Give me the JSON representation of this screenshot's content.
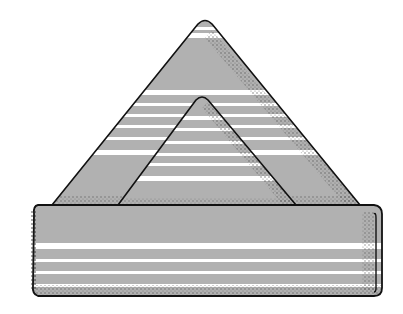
{
  "illustration": {
    "title": "Folded striped napkin (bishop's hat / pyramid fold)",
    "colors": {
      "fabric": "#b1b1b1",
      "stripe": "#ffffff",
      "outline": "#111111",
      "stipple": "#555555",
      "background": "#ffffff"
    },
    "parts": [
      {
        "name": "back-triangle",
        "apex": [
          205,
          20
        ],
        "base_left": [
          52,
          205
        ],
        "base_right": [
          360,
          205
        ]
      },
      {
        "name": "front-triangle",
        "apex": [
          202,
          96
        ],
        "base_left": [
          118,
          205
        ],
        "base_right": [
          296,
          205
        ]
      },
      {
        "name": "folded-band",
        "x": [
          32,
          382
        ],
        "y": [
          205,
          296
        ]
      }
    ]
  }
}
